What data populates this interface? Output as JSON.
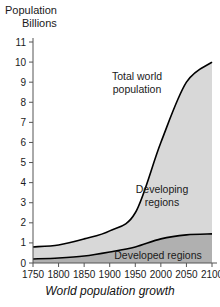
{
  "axis_title": {
    "line1": "Population",
    "line2": "Billions"
  },
  "caption": "World population growth",
  "annotations": {
    "total_line1": "Total world",
    "total_line2": "population",
    "developing_line1": "Developing",
    "developing_line2": "regions",
    "developed": "Developed regions"
  },
  "colors": {
    "developing_fill": "#d8d8d8",
    "developed_fill": "#b0b0b0",
    "curve_stroke": "#000000",
    "axis": "#555555",
    "text": "#1a1a1a"
  },
  "chart_data": {
    "type": "area",
    "title": "World population growth",
    "xlabel": "",
    "ylabel": "Population Billions",
    "xlim": [
      1750,
      2100
    ],
    "ylim": [
      0,
      11
    ],
    "grid": false,
    "legend_position": "inline-annotations",
    "stacked": true,
    "x": [
      1750,
      1800,
      1850,
      1900,
      1950,
      2000,
      2050,
      2100
    ],
    "xticks": [
      1750,
      1800,
      1850,
      1900,
      1950,
      2000,
      2050,
      2100
    ],
    "yticks": [
      0,
      1,
      2,
      3,
      4,
      5,
      6,
      7,
      8,
      9,
      10,
      11
    ],
    "series": [
      {
        "name": "Developed regions",
        "values": [
          0.2,
          0.25,
          0.35,
          0.55,
          0.8,
          1.2,
          1.4,
          1.45
        ]
      },
      {
        "name": "Developing regions",
        "values": [
          0.6,
          0.65,
          0.85,
          1.05,
          1.7,
          4.8,
          7.6,
          8.55
        ]
      }
    ],
    "total": {
      "name": "Total world population",
      "values": [
        0.8,
        0.9,
        1.2,
        1.6,
        2.5,
        6.0,
        9.0,
        10.0
      ]
    }
  }
}
